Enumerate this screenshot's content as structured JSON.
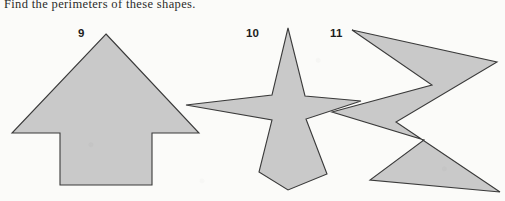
{
  "worksheet": {
    "prompt": "Find the perimeters of these shapes.",
    "background_color": "#fbfbf9",
    "shape_fill_color": "#c9c9c9",
    "shape_outline_color": "#3a3a3a",
    "text_color": "#2b2b2b"
  },
  "figures": [
    {
      "number": "9",
      "name": "arrow-shape",
      "description": "upward-pointing block arrow",
      "points": "106,34 199,133 152,133 152,185 60,185 60,133 12,133"
    },
    {
      "number": "10",
      "name": "four-pointed-star-shape",
      "description": "four-pointed star",
      "points": "288,28 305,96 361,101 306,119 327,174 288,190 259,172 272,120 186,105 272,95"
    },
    {
      "number": "11",
      "name": "zigzag-shape",
      "description": "zigzag lightning-bolt polygon",
      "points": "352,30 497,62 396,122 500,192 370,180 424,140 332,112 432,85"
    }
  ]
}
